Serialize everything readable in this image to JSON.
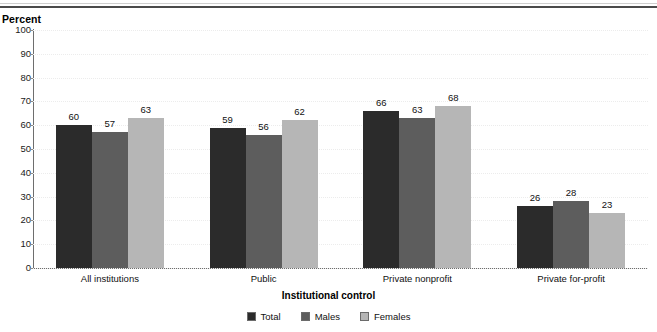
{
  "figure": {
    "y_axis_unit_label": "Percent",
    "x_axis_title": "Institutional control"
  },
  "chart_data": {
    "type": "bar",
    "title": "",
    "xlabel": "Institutional control",
    "ylabel": "Percent",
    "ylim": [
      0,
      100
    ],
    "yticks": [
      0,
      10,
      20,
      30,
      40,
      50,
      60,
      70,
      80,
      90,
      100
    ],
    "ytick_labels": [
      "0",
      "10",
      "20",
      "30",
      "40",
      "50",
      "60",
      "70",
      "80",
      "90",
      "100"
    ],
    "grid": true,
    "legend_position": "bottom-center",
    "categories": [
      "All institutions",
      "Public",
      "Private nonprofit",
      "Private for-profit"
    ],
    "series": [
      {
        "name": "Total",
        "color": "#2b2b2b",
        "values": [
          60,
          59,
          66,
          26
        ],
        "labels": [
          "60",
          "59",
          "66",
          "26"
        ]
      },
      {
        "name": "Males",
        "color": "#5d5d5d",
        "values": [
          57,
          56,
          63,
          28
        ],
        "labels": [
          "57",
          "56",
          "63",
          "28"
        ]
      },
      {
        "name": "Females",
        "color": "#b6b6b6",
        "values": [
          63,
          62,
          68,
          23
        ],
        "labels": [
          "63",
          "62",
          "68",
          "23"
        ]
      }
    ]
  }
}
